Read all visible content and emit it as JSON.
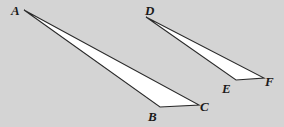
{
  "diagram": {
    "background": "#d4d4d4",
    "fill": "#ffffff",
    "stroke": "#2a2a2a",
    "triangles": [
      {
        "name": "ABC",
        "vertices": {
          "A": {
            "x": 24,
            "y": 10
          },
          "B": {
            "x": 160,
            "y": 107
          },
          "C": {
            "x": 199,
            "y": 105
          }
        }
      },
      {
        "name": "DEF",
        "vertices": {
          "D": {
            "x": 146,
            "y": 17
          },
          "E": {
            "x": 236,
            "y": 80
          },
          "F": {
            "x": 264,
            "y": 78
          }
        }
      }
    ],
    "labels": {
      "A": "A",
      "B": "B",
      "C": "C",
      "D": "D",
      "E": "E",
      "F": "F"
    }
  }
}
